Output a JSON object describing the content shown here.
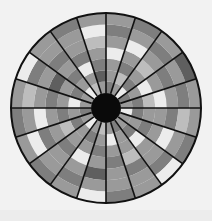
{
  "wheel": {
    "center": [
      106,
      108
    ],
    "outer_radius": 95,
    "hub_radius": 15,
    "sector_count": 20,
    "ring_count": 7,
    "start_angle_deg": 0,
    "colors": {
      "background": "#f2f2f2",
      "spoke": "#111111",
      "hub": "#0a0a0a",
      "rim": "#111111",
      "shades": [
        "#ececec",
        "#bdbdbd",
        "#9a9a9a",
        "#7e7e7e",
        "#5f5f5f"
      ]
    },
    "sectors": [
      [
        2,
        3,
        1,
        0,
        2,
        3,
        2
      ],
      [
        3,
        2,
        0,
        2,
        3,
        2,
        4
      ],
      [
        0,
        3,
        2,
        1,
        2,
        3,
        2
      ],
      [
        2,
        1,
        3,
        2,
        0,
        2,
        3
      ],
      [
        3,
        2,
        2,
        0,
        2,
        3,
        2
      ],
      [
        2,
        4,
        3,
        2,
        1,
        0,
        2
      ],
      [
        1,
        2,
        0,
        3,
        2,
        2,
        3
      ],
      [
        0,
        2,
        3,
        2,
        3,
        2,
        2
      ],
      [
        2,
        3,
        2,
        4,
        2,
        3,
        0
      ],
      [
        2,
        0,
        2,
        3,
        2,
        1,
        2
      ],
      [
        3,
        2,
        3,
        2,
        0,
        2,
        3
      ],
      [
        2,
        3,
        1,
        2,
        3,
        0,
        2
      ],
      [
        0,
        2,
        2,
        3,
        2,
        2,
        3
      ],
      [
        2,
        3,
        2,
        0,
        2,
        3,
        2
      ],
      [
        1,
        2,
        3,
        2,
        4,
        2,
        0
      ],
      [
        2,
        0,
        2,
        3,
        2,
        2,
        3
      ],
      [
        3,
        2,
        2,
        1,
        3,
        2,
        2
      ],
      [
        2,
        3,
        0,
        2,
        2,
        3,
        0
      ],
      [
        2,
        2,
        3,
        2,
        0,
        2,
        3
      ],
      [
        0,
        3,
        2,
        2,
        3,
        1,
        2
      ]
    ]
  }
}
